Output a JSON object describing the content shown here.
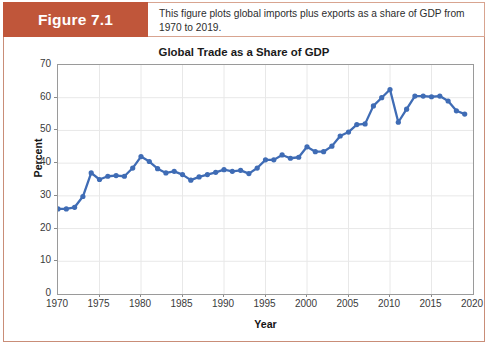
{
  "figure": {
    "number_label": "Figure 7.1",
    "caption": "This figure plots global imports plus exports as a share of GDP from 1970 to 2019.",
    "accent_color": "#c0563a",
    "frame_color": "#c98d78"
  },
  "chart_data": {
    "type": "line",
    "title": "Global Trade as a Share of GDP",
    "xlabel": "Year",
    "ylabel": "Percent",
    "xlim": [
      1970,
      2020
    ],
    "ylim": [
      0,
      70
    ],
    "y_ticks": [
      0,
      10,
      20,
      30,
      40,
      50,
      60,
      70
    ],
    "x_ticks": [
      1970,
      1975,
      1980,
      1985,
      1990,
      1995,
      2000,
      2005,
      2010,
      2015,
      2020
    ],
    "grid": true,
    "legend": null,
    "series_color": "#3f6cb5",
    "marker": "circle",
    "x": [
      1970,
      1971,
      1972,
      1973,
      1974,
      1975,
      1976,
      1977,
      1978,
      1979,
      1980,
      1981,
      1982,
      1983,
      1984,
      1985,
      1986,
      1987,
      1988,
      1989,
      1990,
      1991,
      1992,
      1993,
      1994,
      1995,
      1996,
      1997,
      1998,
      1999,
      2000,
      2001,
      2002,
      2003,
      2004,
      2005,
      2006,
      2007,
      2008,
      2009,
      2010,
      2011,
      2012,
      2013,
      2014,
      2015,
      2016,
      2017,
      2018,
      2019
    ],
    "values": [
      26.0,
      26.0,
      26.5,
      29.8,
      37.0,
      35.0,
      36.0,
      36.2,
      36.0,
      38.5,
      42.0,
      40.5,
      38.3,
      37.0,
      37.5,
      36.5,
      34.8,
      35.8,
      36.5,
      37.2,
      38.0,
      37.5,
      37.8,
      36.8,
      38.5,
      41.0,
      41.0,
      42.5,
      41.5,
      41.8,
      45.0,
      43.5,
      43.5,
      45.2,
      48.3,
      49.5,
      51.8,
      52.0,
      57.5,
      60.0,
      62.5,
      52.5,
      56.5,
      60.5,
      60.5,
      60.3,
      60.5,
      59.0,
      56.0,
      55.0
    ]
  }
}
